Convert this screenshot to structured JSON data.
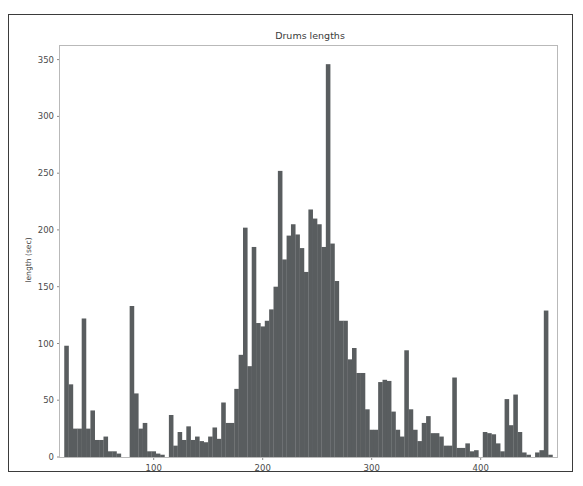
{
  "figure": {
    "title": "Drums lengths",
    "bar_color": "#595d5f",
    "frame_color": "#b9b9b9",
    "outer_border_color": "#3b3b3b",
    "background": "#ffffff",
    "tick_color": "#8a8a8a",
    "label_color": "#4a4a4a"
  },
  "chart_data": {
    "type": "bar",
    "title": "Drums lengths",
    "xlabel": "",
    "ylabel": "length (sec)",
    "xlim": [
      14,
      470
    ],
    "ylim": [
      0,
      362
    ],
    "xticks": [
      100,
      200,
      300,
      400
    ],
    "xtick_labels": [
      "100",
      "200",
      "300",
      "400"
    ],
    "yticks": [
      0,
      50,
      100,
      150,
      200,
      250,
      300,
      350
    ],
    "ytick_labels": [
      "0",
      "50",
      "100",
      "150",
      "200",
      "250",
      "300",
      "350"
    ],
    "grid": false,
    "legend": null,
    "bar_width": 4.2,
    "x": [
      20,
      24,
      28,
      32,
      36,
      40,
      44,
      48,
      52,
      56,
      60,
      64,
      68,
      72,
      76,
      80,
      84,
      88,
      92,
      96,
      100,
      104,
      108,
      112,
      116,
      120,
      124,
      128,
      132,
      136,
      140,
      144,
      148,
      152,
      156,
      160,
      164,
      168,
      172,
      176,
      180,
      184,
      188,
      192,
      196,
      200,
      204,
      208,
      212,
      216,
      220,
      224,
      228,
      232,
      236,
      240,
      244,
      248,
      252,
      256,
      260,
      264,
      268,
      272,
      276,
      280,
      284,
      288,
      292,
      296,
      300,
      304,
      308,
      312,
      316,
      320,
      324,
      328,
      332,
      336,
      340,
      344,
      348,
      352,
      356,
      360,
      364,
      368,
      372,
      376,
      380,
      384,
      388,
      392,
      396,
      400,
      404,
      408,
      412,
      416,
      420,
      424,
      428,
      432,
      436,
      440,
      444,
      448,
      452,
      456,
      460,
      464
    ],
    "values": [
      98,
      64,
      25,
      25,
      122,
      25,
      41,
      15,
      15,
      18,
      5,
      5,
      3,
      0,
      0,
      133,
      56,
      25,
      30,
      5,
      5,
      3,
      2,
      0,
      37,
      10,
      22,
      15,
      27,
      15,
      18,
      14,
      13,
      18,
      26,
      16,
      48,
      30,
      30,
      60,
      90,
      202,
      80,
      185,
      118,
      115,
      120,
      130,
      150,
      252,
      174,
      195,
      205,
      196,
      184,
      163,
      218,
      210,
      205,
      185,
      346,
      188,
      155,
      120,
      120,
      86,
      96,
      74,
      74,
      42,
      24,
      24,
      66,
      68,
      67,
      40,
      24,
      18,
      94,
      42,
      24,
      14,
      30,
      36,
      21,
      21,
      18,
      10,
      10,
      70,
      8,
      8,
      12,
      5,
      6,
      0,
      22,
      21,
      20,
      12,
      5,
      51,
      28,
      55,
      22,
      4,
      2,
      0,
      4,
      6,
      129,
      2
    ]
  }
}
